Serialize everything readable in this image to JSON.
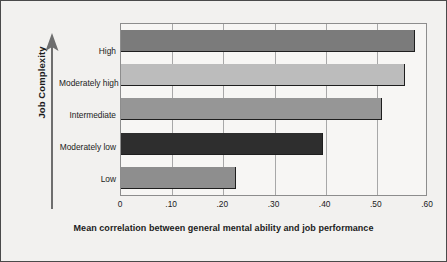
{
  "chart_data": {
    "type": "bar",
    "orientation": "horizontal",
    "title": "",
    "xlabel": "Mean correlation between general mental ability and job performance",
    "ylabel": "Job Complexity",
    "categories": [
      "Low",
      "Moderately low",
      "Intermediate",
      "Moderately high",
      "High"
    ],
    "values": [
      0.225,
      0.395,
      0.51,
      0.555,
      0.575
    ],
    "series": [
      {
        "name": "Mean correlation",
        "values": [
          0.225,
          0.395,
          0.51,
          0.555,
          0.575
        ]
      }
    ],
    "bar_colors": [
      "#8e8e8e",
      "#2e2e2e",
      "#969696",
      "#bcbcbc",
      "#7b7b7b"
    ],
    "xlim": [
      0,
      0.6
    ],
    "ylim": [
      0,
      5
    ],
    "xticks": [
      0,
      0.1,
      0.2,
      0.3,
      0.4,
      0.5,
      0.6
    ],
    "xtick_labels": [
      "0",
      ".10",
      ".20",
      ".30",
      ".40",
      ".50",
      ".60"
    ],
    "grid": "vertical",
    "legend": "none",
    "y_axis_direction": "increasing-upward"
  },
  "figure": {
    "background_color": "#f2f1ef",
    "border_color": "#4a4a4a",
    "plot_background_color": "#f7f6f4",
    "gridline_color": "#a8a8a8",
    "text_color": "#1b1b1b"
  },
  "icons": {
    "y_axis_arrow": "up-arrow-icon"
  }
}
